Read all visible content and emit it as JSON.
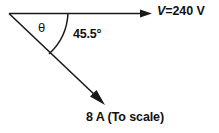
{
  "diagram": {
    "type": "phasor-diagram",
    "background_color": "#ffffff",
    "stroke_color": "#1a1a1a",
    "labels": {
      "voltage_symbol": "V",
      "voltage_value": "=240 V",
      "voltage_full": "V=240 V",
      "angle": "45.5°",
      "theta": "θ",
      "current": "8 A (To scale)"
    },
    "vectors": [
      {
        "name": "voltage-phasor",
        "label": "V=240 V",
        "magnitude": "240 V",
        "direction_deg": 0,
        "arrow": "right"
      },
      {
        "name": "current-phasor",
        "label": "8 A (To scale)",
        "magnitude": "8 A",
        "direction_deg": -45.5,
        "arrow": "down-right"
      }
    ],
    "angles": [
      {
        "name": "phase-angle-arc",
        "label": "45.5°",
        "between": "voltage-phasor and current-phasor"
      },
      {
        "name": "theta-angle",
        "label": "θ",
        "between": "upper-construction-line and current-phasor"
      }
    ]
  }
}
